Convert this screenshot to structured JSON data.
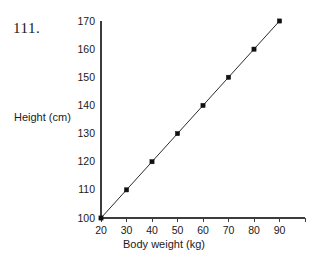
{
  "figure": {
    "item_number": "111.",
    "background_color": "#ffffff",
    "axis_color": "#3c3c3c",
    "series_color": "#111111"
  },
  "chart_data": {
    "type": "line",
    "title": "",
    "subtitle": "",
    "xlabel": "Body weight (kg)",
    "ylabel": "Height (cm)",
    "x": [
      20,
      30,
      40,
      50,
      60,
      70,
      80,
      90
    ],
    "values": [
      100,
      110,
      120,
      130,
      140,
      150,
      160,
      170
    ],
    "series": [
      {
        "name": "Height vs body weight",
        "x": [
          20,
          30,
          40,
          50,
          60,
          70,
          80,
          90
        ],
        "values": [
          100,
          110,
          120,
          130,
          140,
          150,
          160,
          170
        ],
        "marker": "square",
        "color": "#111111"
      }
    ],
    "xlim": [
      20,
      100
    ],
    "ylim": [
      100,
      170
    ],
    "xticks": [
      20,
      30,
      40,
      50,
      60,
      70,
      80,
      90
    ],
    "yticks": [
      100,
      110,
      120,
      130,
      140,
      150,
      160,
      170
    ],
    "xticklabels": [
      "20",
      "30",
      "40",
      "50",
      "60",
      "70",
      "80",
      "90"
    ],
    "yticklabels": [
      "100",
      "110",
      "120",
      "130",
      "140",
      "150",
      "160",
      "170"
    ],
    "grid": false,
    "legend": false,
    "legend_position": "none",
    "annotations": []
  }
}
